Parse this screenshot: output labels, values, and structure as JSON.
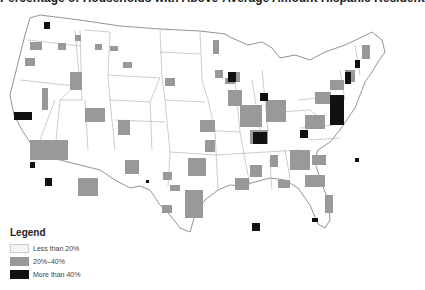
{
  "map": {
    "title_partial": "Percentage of Households with Above-Average Amount Hispanic Resident",
    "region": "Contiguous United States",
    "colors": {
      "low": "#f4f4f4",
      "mid": "#999999",
      "high": "#111111",
      "border": "#888888",
      "background": "#ffffff"
    }
  },
  "legend": {
    "title": "Legend",
    "items": [
      {
        "label": "Less than 20%",
        "color": "#f4f4f4"
      },
      {
        "label": "20%–40%",
        "color": "#999999"
      },
      {
        "label": "More than 40%",
        "color": "#111111"
      }
    ]
  }
}
